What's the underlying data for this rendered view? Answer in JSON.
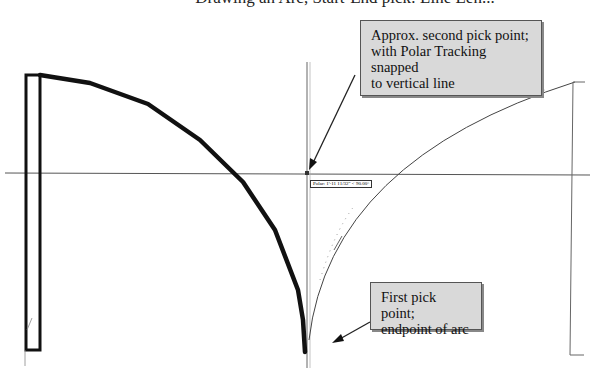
{
  "header": {
    "cut_off_title": "Drawing an Arc, Start-End pick: Line Len..."
  },
  "callouts": {
    "top": {
      "lines": [
        "Approx. second pick point;",
        "with Polar Tracking snapped",
        "to vertical line"
      ]
    },
    "bottom": {
      "lines": [
        "First pick point;",
        "endpoint of arc"
      ]
    }
  },
  "tooltip": {
    "text": "Polar: 1'-11 11/32\" < 90.00°"
  },
  "colors": {
    "thick_line": "#111111",
    "thin_line": "#555555",
    "callout_fill": "#d9d9d9",
    "callout_border": "#555555",
    "background": "#ffffff"
  },
  "geometry": {
    "thick_polyline": "40,75 90,83 148,104 200,140 243,182 275,230 298,290 303,320 305,352",
    "rect": {
      "x": 26,
      "y": 75,
      "w": 14,
      "h": 275
    },
    "horizontal_axis_y": 173,
    "vertical_axis_x": 307,
    "right_bracket_x": 573
  }
}
